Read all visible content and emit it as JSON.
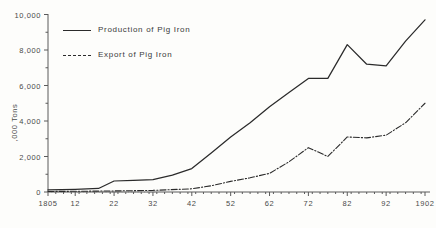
{
  "chart_data": {
    "type": "line",
    "title": "",
    "xlabel": "",
    "ylabel": ",000 Tons",
    "xlim": [
      1805,
      1902
    ],
    "ylim": [
      0,
      10000
    ],
    "grid": false,
    "legend_position": "upper-left-inside",
    "x_tick_labels": [
      "1805",
      "12",
      "22",
      "32",
      "42",
      "52",
      "62",
      "72",
      "82",
      "92",
      "1902"
    ],
    "x_tick_values": [
      1805,
      1812,
      1822,
      1832,
      1842,
      1852,
      1862,
      1872,
      1882,
      1892,
      1902
    ],
    "y_tick_labels": [
      "0",
      "2,000",
      "4,000",
      "6,000",
      "8,000",
      "10,000"
    ],
    "y_tick_values": [
      0,
      2000,
      4000,
      6000,
      8000,
      10000
    ],
    "y_minor_tick_values": [
      1000,
      3000,
      5000,
      7000,
      9000
    ],
    "series": [
      {
        "name": "Production of Pig Iron",
        "style": "solid",
        "color": "#2b2b2b",
        "x": [
          1805,
          1812,
          1818,
          1822,
          1827,
          1832,
          1837,
          1842,
          1847,
          1852,
          1857,
          1862,
          1867,
          1872,
          1877,
          1882,
          1887,
          1892,
          1897,
          1902
        ],
        "values": [
          120,
          150,
          200,
          620,
          650,
          700,
          950,
          1320,
          2200,
          3100,
          3900,
          4800,
          5600,
          6400,
          6400,
          8300,
          7200,
          7100,
          8500,
          9700
        ]
      },
      {
        "name": "Export of Pig Iron",
        "style": "dash-dot",
        "color": "#2b2b2b",
        "x": [
          1805,
          1812,
          1822,
          1832,
          1842,
          1847,
          1852,
          1857,
          1862,
          1867,
          1872,
          1877,
          1882,
          1887,
          1892,
          1897,
          1902
        ],
        "values": [
          30,
          40,
          60,
          90,
          180,
          350,
          600,
          800,
          1050,
          1700,
          2500,
          2000,
          3100,
          3050,
          3200,
          3900,
          5000
        ]
      }
    ],
    "baseline_guide": {
      "style": "dotted",
      "description": "faint dotted guide along the zero baseline from the y-axis to about 1832"
    }
  },
  "legend": {
    "production_label": "Production of Pig Iron",
    "export_label": "Export of Pig Iron"
  }
}
